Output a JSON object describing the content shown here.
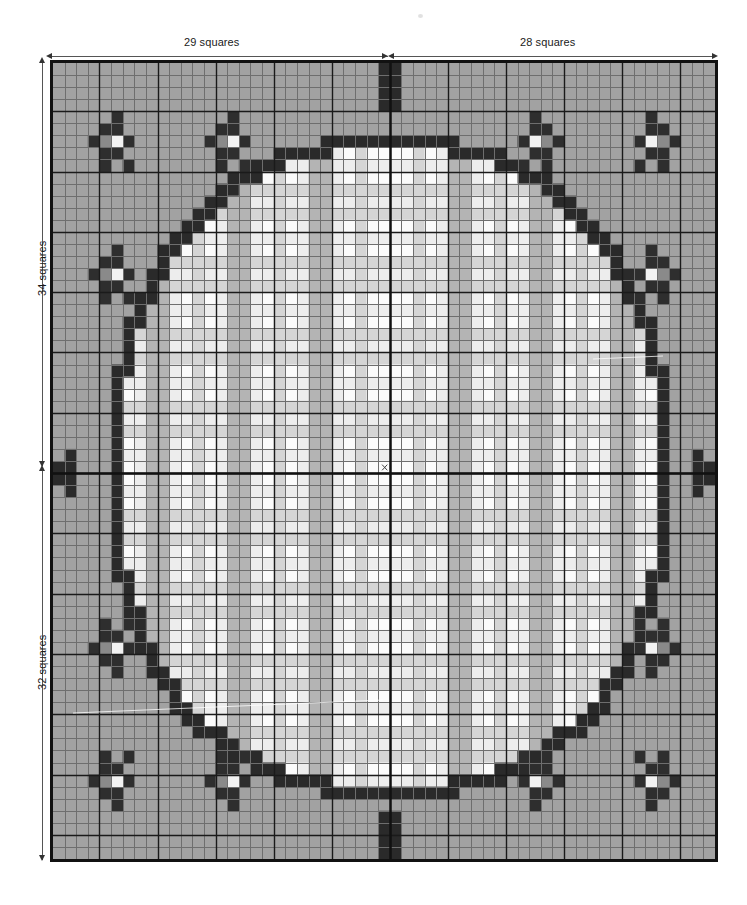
{
  "chart_data": {
    "type": "heatmap",
    "title": "",
    "grid": {
      "columns": 57,
      "rows": 66,
      "cell_px": 11.7
    },
    "center": {
      "column_index": 29,
      "row_index": 34
    },
    "xlabel": "",
    "ylabel": "",
    "legend_position": "none",
    "grid_on": true,
    "palette": {
      "ground": "#a2a2a2",
      "outline_dark": "#2a2a2a",
      "plaid_white": "#fbfbfb",
      "plaid_light": "#ededed",
      "plaid_mid": "#d5d5d5",
      "plaid_grey": "#b4b4b4",
      "motif_dark": "#2e2e2e",
      "motif_mid": "#8a8a8a",
      "motif_light": "#f2f2f2",
      "gridline_minor": "#6e6e6e",
      "gridline_major": "#1a1a1a",
      "border": "#111111",
      "axis_line": "#111111"
    }
  },
  "annotations": {
    "top_left": {
      "label": "29 squares",
      "value": 29,
      "unit": "squares"
    },
    "top_right": {
      "label": "28 squares",
      "value": 28,
      "unit": "squares"
    },
    "left_upper": {
      "label": "34 squares",
      "value": 34,
      "unit": "squares"
    },
    "left_lower": {
      "label": "32 squares",
      "value": 32,
      "unit": "squares"
    }
  },
  "center_marker": {
    "glyph": "×",
    "name": "center-cross-marker"
  }
}
